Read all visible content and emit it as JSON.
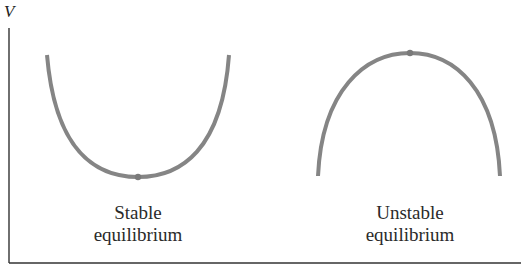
{
  "diagram": {
    "y_axis_label": "V",
    "colors": {
      "curve": "#858585",
      "axis": "#333333",
      "text": "#2a2a2a"
    },
    "left_panel": {
      "label_line1": "Stable",
      "label_line2": "equilibrium",
      "shape": "concave-up parabola",
      "equilibrium_point": "minimum"
    },
    "right_panel": {
      "label_line1": "Unstable",
      "label_line2": "equilibrium",
      "shape": "concave-down parabola",
      "equilibrium_point": "maximum"
    }
  }
}
